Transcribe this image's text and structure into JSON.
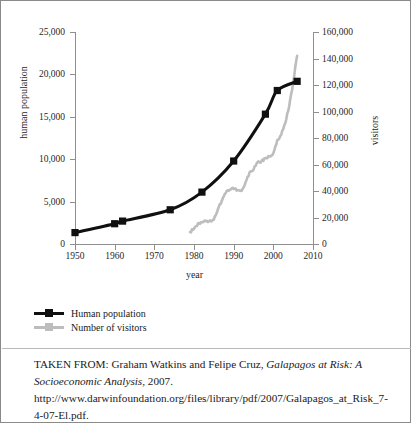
{
  "chart_data": {
    "type": "line",
    "title": "",
    "xlabel": "year",
    "ylabel": "human population",
    "ylabel_secondary": "visitors",
    "xlim": [
      1950,
      2010
    ],
    "ylim": [
      0,
      25000
    ],
    "ylim_secondary": [
      0,
      160000
    ],
    "grid": false,
    "legend_position": "below-left",
    "xticks": [
      "1950",
      "1960",
      "1970",
      "1980",
      "1990",
      "2000",
      "2010"
    ],
    "xtick_values": [
      1950,
      1960,
      1970,
      1980,
      1990,
      2000,
      2010
    ],
    "yticks_left": [
      "0",
      "5,000",
      "10,000",
      "15,000",
      "20,000",
      "25,000"
    ],
    "ytick_values_left": [
      0,
      5000,
      10000,
      15000,
      20000,
      25000
    ],
    "yticks_right": [
      "0",
      "20,000",
      "40,000",
      "60,000",
      "80,000",
      "100,000",
      "120,000",
      "140,000",
      "160,000"
    ],
    "ytick_values_right": [
      0,
      20000,
      40000,
      60000,
      80000,
      100000,
      120000,
      140000,
      160000
    ],
    "series": [
      {
        "name": "Human population",
        "axis": "left",
        "color": "#101010",
        "marker": "square",
        "x": [
          1950,
          1960,
          1962,
          1974,
          1982,
          1990,
          1998,
          2001,
          2006
        ],
        "values": [
          1346,
          2391,
          2700,
          4037,
          6119,
          9785,
          15311,
          18100,
          19184
        ]
      },
      {
        "name": "Number of visitors",
        "axis": "right",
        "color": "#bdbdbd",
        "marker": "none",
        "x": [
          1979,
          1980,
          1981,
          1982,
          1983,
          1984,
          1985,
          1986,
          1987,
          1988,
          1989,
          1990,
          1991,
          1992,
          1993,
          1994,
          1995,
          1996,
          1997,
          1998,
          1999,
          2000,
          2001,
          2002,
          2003,
          2004,
          2005,
          2006
        ],
        "values": [
          9000,
          11500,
          15500,
          16500,
          17200,
          17800,
          18400,
          26000,
          32500,
          38500,
          41000,
          41500,
          40500,
          40000,
          46500,
          54000,
          56000,
          61800,
          62500,
          64800,
          66000,
          68500,
          78500,
          82500,
          91000,
          104000,
          122000,
          142000
        ]
      }
    ]
  },
  "legend": {
    "items": [
      {
        "label": "Human population",
        "color": "#101010",
        "marker": "square"
      },
      {
        "label": "Number of visitors",
        "color": "#bdbdbd",
        "marker": "square"
      }
    ]
  },
  "caption": {
    "prefix": "TAKEN FROM: Graham Watkins and Felipe Cruz, ",
    "title_italic_1": "Galapagos at Risk: A Socioeconomic Analysis",
    "middle": ", 2007. ",
    "url": "http://www.darwinfoundation.org/files/library/pdf/2007/Galapagos_at_Risk_7-4-07-El.pdf."
  }
}
